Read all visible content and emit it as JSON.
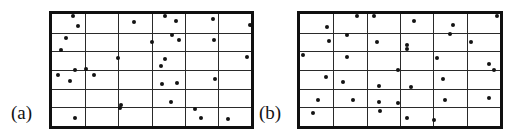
{
  "figure": {
    "width": 527,
    "height": 139,
    "background_color": "#ffffff",
    "dot_color": "#131313",
    "grid_line_color": "#2a2a2a",
    "border_color": "#101010"
  },
  "chart_data": {
    "type": "scatter",
    "title": "",
    "xlabel": "",
    "ylabel": "",
    "xlim": [
      0,
      6
    ],
    "ylim": [
      0,
      6
    ],
    "grid": true,
    "legend_position": "none",
    "panels": [
      {
        "label": "(a)",
        "name": "panel-a",
        "frame": {
          "x": 49,
          "y": 11,
          "width": 205,
          "height": 118
        },
        "grid_columns": 6,
        "grid_rows": 6,
        "point_count": 32,
        "points": [
          [
            0.62,
            5.88
          ],
          [
            0.77,
            5.38
          ],
          [
            2.48,
            5.57
          ],
          [
            3.4,
            5.88
          ],
          [
            3.74,
            5.62
          ],
          [
            4.86,
            5.74
          ],
          [
            5.97,
            5.42
          ],
          [
            0.41,
            4.72
          ],
          [
            3.0,
            4.52
          ],
          [
            3.62,
            4.9
          ],
          [
            3.83,
            4.62
          ],
          [
            4.88,
            4.63
          ],
          [
            0.26,
            4.05
          ],
          [
            2.0,
            3.62
          ],
          [
            3.4,
            3.58
          ],
          [
            3.28,
            3.22
          ],
          [
            5.88,
            3.72
          ],
          [
            0.7,
            3.02
          ],
          [
            1.02,
            3.06
          ],
          [
            0.17,
            2.76
          ],
          [
            1.25,
            2.72
          ],
          [
            0.55,
            2.4
          ],
          [
            4.92,
            2.52
          ],
          [
            3.32,
            2.26
          ],
          [
            3.78,
            2.28
          ],
          [
            2.08,
            1.12
          ],
          [
            2.05,
            0.95
          ],
          [
            3.6,
            1.3
          ],
          [
            4.3,
            0.92
          ],
          [
            0.7,
            0.45
          ],
          [
            4.48,
            0.42
          ],
          [
            5.3,
            0.4
          ]
        ]
      },
      {
        "label": "(b)",
        "name": "panel-b",
        "frame": {
          "x": 297,
          "y": 11,
          "width": 206,
          "height": 118
        },
        "grid_columns": 6,
        "grid_rows": 6,
        "point_count": 34,
        "points": [
          [
            1.72,
            5.92
          ],
          [
            2.22,
            5.9
          ],
          [
            3.42,
            5.62
          ],
          [
            4.58,
            5.42
          ],
          [
            5.92,
            5.88
          ],
          [
            0.82,
            5.28
          ],
          [
            1.42,
            4.9
          ],
          [
            4.5,
            4.95
          ],
          [
            0.88,
            4.58
          ],
          [
            2.32,
            4.5
          ],
          [
            3.2,
            4.32
          ],
          [
            5.12,
            4.48
          ],
          [
            0.08,
            3.78
          ],
          [
            1.42,
            3.72
          ],
          [
            3.22,
            4.12
          ],
          [
            4.1,
            3.62
          ],
          [
            5.68,
            3.35
          ],
          [
            2.95,
            3.02
          ],
          [
            5.82,
            2.98
          ],
          [
            0.78,
            2.62
          ],
          [
            1.28,
            2.38
          ],
          [
            4.3,
            2.52
          ],
          [
            2.38,
            2.12
          ],
          [
            3.32,
            2.1
          ],
          [
            0.55,
            1.38
          ],
          [
            1.58,
            1.42
          ],
          [
            2.38,
            1.3
          ],
          [
            2.95,
            1.22
          ],
          [
            4.35,
            1.4
          ],
          [
            5.68,
            1.48
          ],
          [
            0.38,
            0.72
          ],
          [
            2.4,
            0.82
          ],
          [
            3.22,
            0.42
          ],
          [
            4.02,
            0.3
          ]
        ]
      }
    ]
  }
}
